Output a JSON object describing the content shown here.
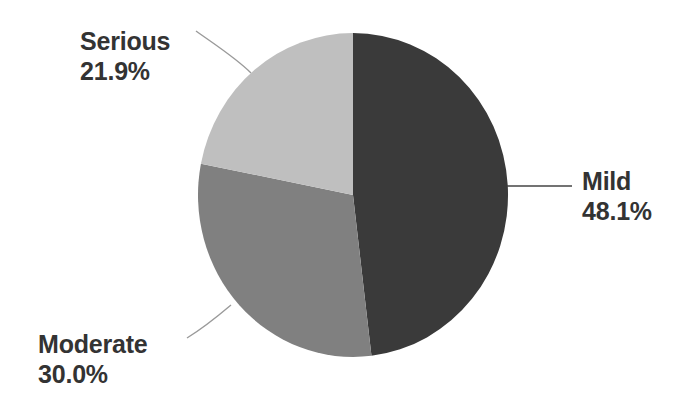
{
  "chart_data": {
    "type": "pie",
    "title": "",
    "categories": [
      "Mild",
      "Moderate",
      "Serious"
    ],
    "values": [
      48.1,
      30.0,
      21.9
    ],
    "value_unit": "%",
    "colors": [
      "#3a3a3a",
      "#808080",
      "#bfbfbf"
    ],
    "legend": "none",
    "labels_position": "outside-with-leader-lines",
    "start_angle_deg": 0,
    "direction": "clockwise",
    "slices": [
      {
        "name": "Mild",
        "value": 48.1,
        "display_value": "48.1%",
        "color": "#3a3a3a",
        "label_side": "right"
      },
      {
        "name": "Moderate",
        "value": 30.0,
        "display_value": "30.0%",
        "color": "#808080",
        "label_side": "bottom-left"
      },
      {
        "name": "Serious",
        "value": 21.9,
        "display_value": "21.9%",
        "color": "#bfbfbf",
        "label_side": "top-left"
      }
    ]
  },
  "labels": {
    "mild": {
      "name": "Mild",
      "value": "48.1%"
    },
    "moderate": {
      "name": "Moderate",
      "value": "30.0%"
    },
    "serious": {
      "name": "Serious",
      "value": "21.9%"
    }
  },
  "style": {
    "background": "#ffffff",
    "text_color": "#333333",
    "leader_line_color": "#9a9a9a"
  }
}
